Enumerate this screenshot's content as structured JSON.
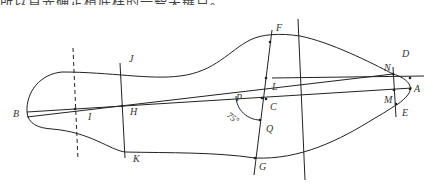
{
  "caption": "所以首先确定楦底样的一些关键点。",
  "diagram": {
    "type": "shoe-last bottom pattern construction",
    "points": {
      "A": "A",
      "B": "B",
      "C": "C",
      "D": "D",
      "E": "E",
      "F": "F",
      "G": "G",
      "H": "H",
      "I": "I",
      "J": "J",
      "K": "K",
      "L": "L",
      "M": "M",
      "N": "N",
      "P": "P",
      "Q": "Q"
    },
    "angle_label": "75°",
    "stroke_color": "#222222",
    "label_color": "#333333"
  }
}
